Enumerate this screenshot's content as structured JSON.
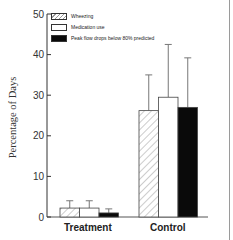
{
  "chart_data": {
    "type": "bar",
    "title": "",
    "xlabel": "",
    "ylabel": "Percentage of Days",
    "ylim": [
      0,
      50
    ],
    "yticks": [
      0,
      10,
      20,
      30,
      40,
      50
    ],
    "categories": [
      "Treatment",
      "Control"
    ],
    "series": [
      {
        "name": "Wheezing",
        "pattern": "hatched",
        "values": [
          2.2,
          26.2
        ],
        "error_upper": [
          4.0,
          35.0
        ]
      },
      {
        "name": "Medication use",
        "pattern": "white",
        "values": [
          2.2,
          29.5
        ],
        "error_upper": [
          4.0,
          42.5
        ]
      },
      {
        "name": "Peak flow drops below 80% predicted",
        "pattern": "black",
        "values": [
          1.0,
          27.0
        ],
        "error_upper": [
          2.0,
          39.2
        ]
      }
    ],
    "legend_position": "top-left inside",
    "grid": false
  },
  "colors": {
    "axis": "#333333",
    "hatch": "#999999",
    "black_bar": "#0a0a0a",
    "white_bar": "#ffffff"
  }
}
